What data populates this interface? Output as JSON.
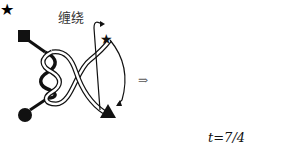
{
  "diagram": {
    "left_panel": {
      "label": "缠绕"
    },
    "transition_symbol": "⇒",
    "right_panel": {
      "label": "t=7/4"
    },
    "shapes": [
      "square",
      "circle",
      "star",
      "triangle"
    ]
  }
}
